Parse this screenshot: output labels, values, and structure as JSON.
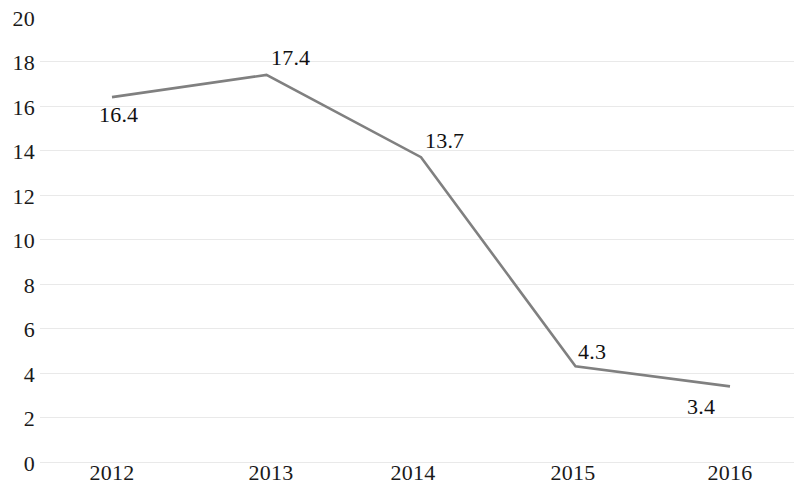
{
  "chart_data": {
    "type": "line",
    "title": "",
    "subtitle": "",
    "xlabel": "",
    "ylabel": "",
    "categories": [
      "2012",
      "2013",
      "2014",
      "2015",
      "2016"
    ],
    "values": [
      16.4,
      17.4,
      13.7,
      4.3,
      3.4
    ],
    "series": [
      {
        "name": "",
        "values": [
          16.4,
          17.4,
          13.7,
          4.3,
          3.4
        ],
        "color": "#808080"
      }
    ],
    "point_labels": [
      "16.4",
      "17.4",
      "13.7",
      "4.3",
      "3.4"
    ],
    "ylim": [
      0,
      20
    ],
    "ytick_step": 2,
    "ytick_labels": [
      "20",
      "18",
      "16",
      "14",
      "12",
      "10",
      "8",
      "6",
      "4",
      "2",
      "0"
    ],
    "ytick_values": [
      20,
      18,
      16,
      14,
      12,
      10,
      8,
      6,
      4,
      2,
      0
    ],
    "xtick_labels": [
      "2012",
      "2013",
      "2014",
      "2015",
      "2016"
    ],
    "grid": true,
    "grid_axis": "y",
    "legend": false,
    "legend_position": "none",
    "markers": false,
    "background_color": "#ffffff",
    "line_color": "#808080",
    "gridline_color": "#e9e9e9",
    "text_color": "#1a1a1a",
    "annotations": []
  }
}
